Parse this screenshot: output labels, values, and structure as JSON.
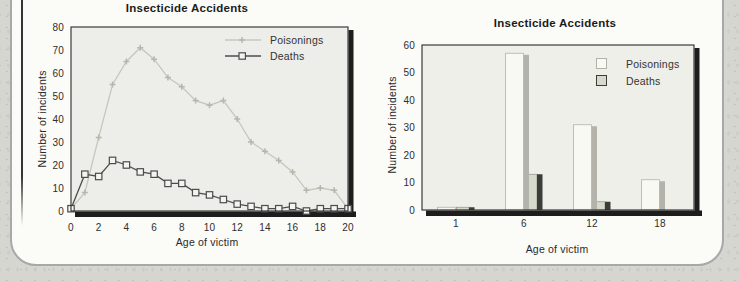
{
  "page": {
    "background_color": "#d6d6d1",
    "panel_bg": "#fbfbf8",
    "panel_border_color": "#a8a8a8"
  },
  "chart_data": [
    {
      "type": "line",
      "title": "Insecticide Accidents",
      "xlabel": "Age of victim",
      "ylabel": "Number of incidents",
      "xlim": [
        0,
        20
      ],
      "ylim": [
        0,
        80
      ],
      "xticks": [
        0,
        2,
        4,
        6,
        8,
        10,
        12,
        14,
        16,
        18,
        20
      ],
      "yticks": [
        0,
        10,
        20,
        30,
        40,
        50,
        60,
        70,
        80
      ],
      "grid": false,
      "legend_position": "top-right-inside",
      "plot_bg": "#edeee9",
      "frame_color": "#2a2a2a",
      "shadow_color": "#1d1d1d",
      "x": [
        0,
        1,
        2,
        3,
        4,
        5,
        6,
        7,
        8,
        9,
        10,
        11,
        12,
        13,
        14,
        15,
        16,
        17,
        18,
        19,
        20
      ],
      "series": [
        {
          "name": "Poisonings",
          "marker": "plus",
          "color": "#c3c8bc",
          "marker_color": "#b2b9ac",
          "values": [
            1,
            8,
            32,
            55,
            65,
            71,
            66,
            58,
            54,
            48,
            46,
            48,
            40,
            30,
            26,
            22,
            17,
            9,
            10,
            9,
            1
          ]
        },
        {
          "name": "Deaths",
          "marker": "square",
          "color": "#4c4c4c",
          "marker_fill": "#f4f4f0",
          "values": [
            1,
            16,
            15,
            22,
            20,
            17,
            16,
            12,
            12,
            8,
            7,
            5,
            3,
            2,
            1,
            1,
            2,
            0,
            1,
            1,
            1
          ]
        }
      ]
    },
    {
      "type": "bar",
      "title": "Insecticide Accidents",
      "xlabel": "Age of victim",
      "ylabel": "Number of incidents",
      "categories": [
        "1",
        "6",
        "12",
        "18"
      ],
      "ylim": [
        0,
        60
      ],
      "yticks": [
        0,
        10,
        20,
        30,
        40,
        50,
        60
      ],
      "grid": false,
      "legend_position": "top-right-inside",
      "plot_bg": "#eeefe9",
      "frame_color": "#2a2a2a",
      "shadow_color": "#1d1d1d",
      "series": [
        {
          "name": "Poisonings",
          "color": "#f9f9f4",
          "edge_color": "#b2b2aa",
          "side_color": "#b3b3ab",
          "values": [
            1,
            57,
            31,
            11
          ]
        },
        {
          "name": "Deaths",
          "color": "#d6dacd",
          "edge_color": "#90908a",
          "side_color": "#3c3c38",
          "values": [
            1,
            13,
            3,
            0
          ]
        }
      ]
    }
  ]
}
